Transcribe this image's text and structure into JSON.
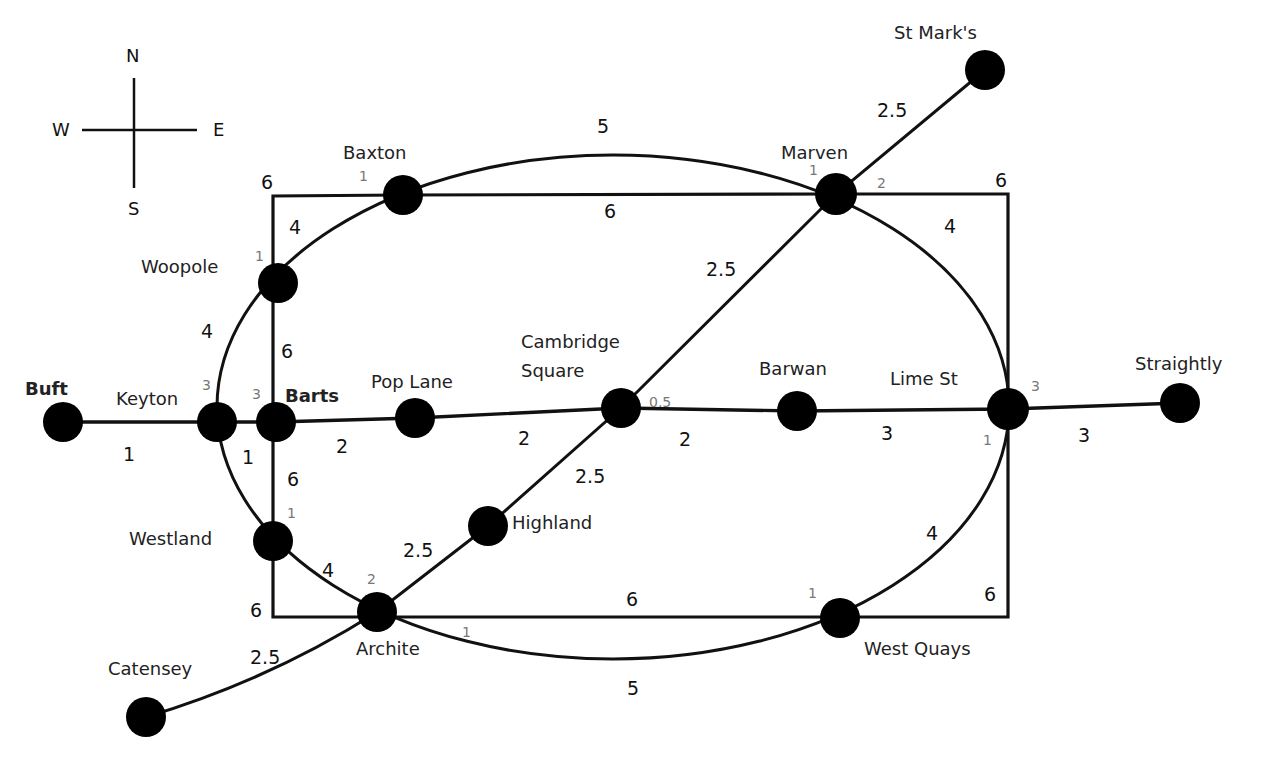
{
  "diagram": {
    "type": "network-map",
    "title": "",
    "compass": {
      "north": "N",
      "south": "S",
      "east": "E",
      "west": "W"
    },
    "colors": {
      "line": "#111111",
      "station": "#000000",
      "label": "#222222",
      "minor_label": "#777777",
      "background": "#ffffff"
    },
    "stations": [
      {
        "id": "buft",
        "name": "Buft"
      },
      {
        "id": "keyton",
        "name": "Keyton"
      },
      {
        "id": "barts",
        "name": "Barts"
      },
      {
        "id": "pop_lane",
        "name": "Pop Lane"
      },
      {
        "id": "cambridge_square",
        "name": "Cambridge Square",
        "line1": "Cambridge",
        "line2": "Square"
      },
      {
        "id": "barwan",
        "name": "Barwan"
      },
      {
        "id": "lime_st",
        "name": "Lime St"
      },
      {
        "id": "straightly",
        "name": "Straightly"
      },
      {
        "id": "baxton",
        "name": "Baxton"
      },
      {
        "id": "marven",
        "name": "Marven"
      },
      {
        "id": "st_marks",
        "name": "St Mark's"
      },
      {
        "id": "woopole",
        "name": "Woopole"
      },
      {
        "id": "westland",
        "name": "Westland"
      },
      {
        "id": "archite",
        "name": "Archite"
      },
      {
        "id": "highland",
        "name": "Highland"
      },
      {
        "id": "west_quays",
        "name": "West Quays"
      },
      {
        "id": "catensey",
        "name": "Catensey"
      }
    ],
    "edges": [
      {
        "from": "Buft",
        "to": "Keyton",
        "weight": "1",
        "line": "straight"
      },
      {
        "from": "Keyton",
        "to": "Barts",
        "weight": "1",
        "line": "straight"
      },
      {
        "from": "Barts",
        "to": "Pop Lane",
        "weight": "2",
        "line": "straight"
      },
      {
        "from": "Pop Lane",
        "to": "Cambridge Square",
        "weight": "2",
        "line": "straight"
      },
      {
        "from": "Cambridge Square",
        "to": "Barwan",
        "weight": "2",
        "line": "straight"
      },
      {
        "from": "Barwan",
        "to": "Lime St",
        "weight": "3",
        "line": "straight"
      },
      {
        "from": "Lime St",
        "to": "Straightly",
        "weight": "3",
        "line": "straight"
      },
      {
        "from": "Catensey",
        "to": "Archite",
        "weight": "2.5",
        "line": "diagonal"
      },
      {
        "from": "Archite",
        "to": "Highland",
        "weight": "2.5",
        "line": "diagonal"
      },
      {
        "from": "Highland",
        "to": "Cambridge Square",
        "weight": "2.5",
        "line": "diagonal"
      },
      {
        "from": "Cambridge Square",
        "to": "Marven",
        "weight": "2.5",
        "line": "diagonal"
      },
      {
        "from": "Marven",
        "to": "St Mark's",
        "weight": "2.5",
        "line": "diagonal"
      },
      {
        "from": "Baxton",
        "to": "Marven",
        "weight": "5",
        "line": "ellipse"
      },
      {
        "from": "Marven",
        "to": "Lime St",
        "weight": "4",
        "line": "ellipse"
      },
      {
        "from": "Lime St",
        "to": "West Quays",
        "weight": "4",
        "line": "ellipse"
      },
      {
        "from": "West Quays",
        "to": "Archite",
        "weight": "5",
        "line": "ellipse"
      },
      {
        "from": "Archite",
        "to": "Westland",
        "weight": "4",
        "line": "ellipse"
      },
      {
        "from": "Westland",
        "to": "Keyton",
        "weight": "1",
        "line": "ellipse"
      },
      {
        "from": "Keyton",
        "to": "Woopole",
        "weight": "4",
        "line": "ellipse"
      },
      {
        "from": "Woopole",
        "to": "Baxton",
        "weight": "4",
        "line": "ellipse"
      },
      {
        "from": "Baxton",
        "to": "Marven",
        "weight": "6",
        "line": "rectangle"
      },
      {
        "from": "Marven",
        "to": "Lime St",
        "weight": "6",
        "line": "rectangle"
      },
      {
        "from": "Lime St",
        "to": "West Quays",
        "weight": "6",
        "line": "rectangle"
      },
      {
        "from": "West Quays",
        "to": "Archite",
        "weight": "6",
        "line": "rectangle"
      },
      {
        "from": "Archite",
        "to": "Westland",
        "weight": "6",
        "line": "rectangle"
      },
      {
        "from": "Westland",
        "to": "Barts",
        "weight": "6",
        "line": "rectangle"
      },
      {
        "from": "Barts",
        "to": "Woopole",
        "weight": "6",
        "line": "rectangle"
      },
      {
        "from": "Woopole",
        "to": "Baxton",
        "weight": "6",
        "line": "rectangle"
      }
    ],
    "interchange_times": [
      {
        "station": "Baxton",
        "value": "1"
      },
      {
        "station": "Marven",
        "value": "1"
      },
      {
        "station": "Marven",
        "value": "2"
      },
      {
        "station": "Woopole",
        "value": "1"
      },
      {
        "station": "Keyton",
        "value": "3"
      },
      {
        "station": "Barts",
        "value": "3"
      },
      {
        "station": "Cambridge Square",
        "value": "0.5"
      },
      {
        "station": "Lime St",
        "value": "3"
      },
      {
        "station": "Lime St",
        "value": "1"
      },
      {
        "station": "Westland",
        "value": "1"
      },
      {
        "station": "Archite",
        "value": "2"
      },
      {
        "station": "Archite",
        "value": "1"
      },
      {
        "station": "West Quays",
        "value": "1"
      }
    ]
  },
  "labels": {
    "w_6_top_left": "6",
    "w_4_woopole_baxton": "4",
    "w_5_top": "5",
    "w_6_top": "6",
    "w_6_top_right": "6",
    "w_4_marven_lime": "4",
    "w_2_5_stmarks": "2.5",
    "w_2_5_camb_marven": "2.5",
    "w_4_keyton_woopole": "4",
    "w_6_barts_woopole": "6",
    "w_1_buft": "1",
    "w_1_keyton_barts": "1",
    "w_2_barts_pop": "2",
    "w_2_pop_camb": "2",
    "w_2_camb_barwan": "2",
    "w_3_barwan_lime": "3",
    "w_3_lime_straightly": "3",
    "w_6_westland_barts": "6",
    "w_2_5_highland_camb": "2.5",
    "w_2_5_archite_highland": "2.5",
    "w_4_archite_westland": "4",
    "w_6_bottom_left": "6",
    "w_2_5_catensey": "2.5",
    "w_6_bottom": "6",
    "w_5_bottom": "5",
    "w_4_lime_wq": "4",
    "w_6_bottom_right": "6",
    "i_baxton": "1",
    "i_marven_1": "1",
    "i_marven_2": "2",
    "i_woopole": "1",
    "i_keyton": "3",
    "i_barts": "3",
    "i_camb": "0.5",
    "i_lime_3": "3",
    "i_lime_1": "1",
    "i_westland": "1",
    "i_archite_2": "2",
    "i_archite_1": "1",
    "i_wq": "1"
  }
}
